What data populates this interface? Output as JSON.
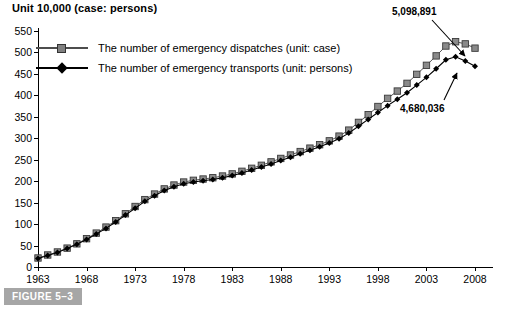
{
  "figure": {
    "unit_title": "Unit 10,000 (case: persons)",
    "caption": "FIGURE 5–3"
  },
  "legend": {
    "position": "top-left-inside",
    "items": [
      {
        "label": "The number of emergency dispatches (unit: case)",
        "marker": "square-marker",
        "color": "#808080"
      },
      {
        "label": "The number of emergency transports (unit: persons)",
        "marker": "diamond-marker",
        "color": "#000000"
      }
    ]
  },
  "annotations": [
    {
      "text": "5,098,891",
      "name": "annotation-dispatches-2008"
    },
    {
      "text": "4,680,036",
      "name": "annotation-transports-2008"
    }
  ],
  "chart_data": {
    "type": "line",
    "title": "Unit 10,000 (case: persons)",
    "xlabel": "",
    "ylabel": "",
    "ylim": [
      0,
      550
    ],
    "ytick_step": 50,
    "ytick_labels": [
      "0",
      "50",
      "100",
      "150",
      "200",
      "250",
      "300",
      "350",
      "400",
      "450",
      "500",
      "550"
    ],
    "xlim": [
      1963,
      2008
    ],
    "xtick_labels": [
      "1963",
      "1968",
      "1973",
      "1978",
      "1983",
      "1988",
      "1993",
      "1998",
      "2003",
      "2008"
    ],
    "grid": false,
    "legend_position": "upper left",
    "x": [
      1963,
      1964,
      1965,
      1966,
      1967,
      1968,
      1969,
      1970,
      1971,
      1972,
      1973,
      1974,
      1975,
      1976,
      1977,
      1978,
      1979,
      1980,
      1981,
      1982,
      1983,
      1984,
      1985,
      1986,
      1987,
      1988,
      1989,
      1990,
      1991,
      1992,
      1993,
      1994,
      1995,
      1996,
      1997,
      1998,
      1999,
      2000,
      2001,
      2002,
      2003,
      2004,
      2005,
      2006,
      2007,
      2008
    ],
    "series": [
      {
        "name": "The number of emergency dispatches (unit: case)",
        "marker": "square",
        "color": "#808080",
        "values": [
          21,
          28,
          35,
          44,
          54,
          66,
          79,
          93,
          108,
          124,
          141,
          157,
          170,
          182,
          191,
          198,
          202,
          205,
          208,
          212,
          217,
          223,
          230,
          237,
          245,
          253,
          261,
          269,
          277,
          285,
          294,
          305,
          319,
          337,
          355,
          374,
          393,
          410,
          428,
          449,
          470,
          492,
          515,
          525,
          520,
          510
        ]
      },
      {
        "name": "The number of emergency transports (unit: persons)",
        "marker": "diamond",
        "color": "#000000",
        "values": [
          20,
          27,
          34,
          43,
          53,
          64,
          77,
          90,
          105,
          121,
          137,
          153,
          166,
          178,
          187,
          194,
          198,
          201,
          204,
          208,
          213,
          219,
          226,
          233,
          240,
          248,
          256,
          264,
          272,
          280,
          289,
          299,
          312,
          328,
          344,
          360,
          376,
          391,
          406,
          424,
          442,
          462,
          483,
          490,
          480,
          468
        ]
      }
    ],
    "annotations": [
      {
        "text": "5,098,891",
        "points_to_year": 2008,
        "points_to_series": "The number of emergency dispatches (unit: case)"
      },
      {
        "text": "4,680,036",
        "points_to_year": 2008,
        "points_to_series": "The number of emergency transports (unit: persons)"
      }
    ]
  }
}
